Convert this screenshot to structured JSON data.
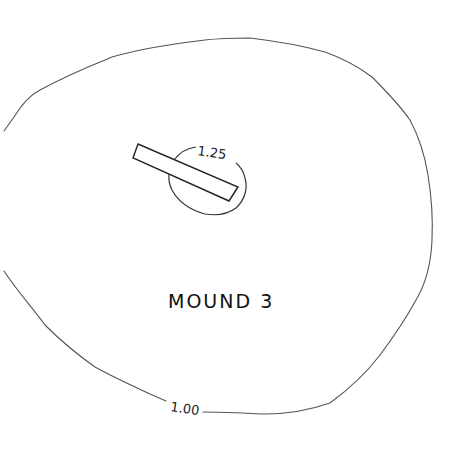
{
  "diagram": {
    "title": "MOUND 3",
    "contours": [
      {
        "label": "1.00",
        "description": "outer contour line"
      },
      {
        "label": "1.25",
        "description": "inner contour line around summit"
      }
    ],
    "features": [
      {
        "type": "rectangle",
        "description": "excavation trench"
      }
    ],
    "colors": {
      "background": "#ffffff",
      "line": "#555555",
      "text": "#111111"
    }
  }
}
